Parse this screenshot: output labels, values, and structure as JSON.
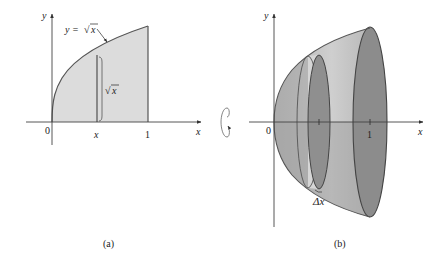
{
  "panels": [
    {
      "id": "a",
      "caption": "(a)",
      "axis_x_label": "x",
      "axis_y_label": "y",
      "origin_label": "0",
      "tick_x_label": "x",
      "tick_one_label": "1",
      "curve_label": "y = √x",
      "curve_label_parts": {
        "lhs": "y =",
        "root": "√",
        "arg": "x"
      },
      "strip_height_label": {
        "root": "√",
        "arg": "x"
      },
      "region_fill": "#dcdcdc"
    },
    {
      "id": "b",
      "caption": "(b)",
      "axis_x_label": "x",
      "axis_y_label": "y",
      "origin_label": "0",
      "tick_one_label": "1",
      "slice_width_label": "Δx",
      "solid_fill_light": "#c8c8c8",
      "solid_fill_dark": "#8e8e8e"
    }
  ],
  "rotation_indicator": "rotate-about-x-axis"
}
